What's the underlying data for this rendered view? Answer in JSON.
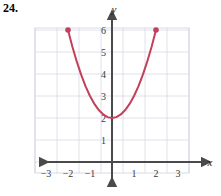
{
  "problem": {
    "number": "24."
  },
  "colors": {
    "curve": "#C2405C",
    "point": "#C2405C",
    "axis": "#4a4a4a",
    "grid": "#d8d8e4",
    "grid_border": "#cfcfdd",
    "text": "#3a3a3a",
    "background": "#ffffff"
  },
  "chart_data": {
    "type": "line",
    "title": "",
    "xlabel": "x",
    "ylabel": "y",
    "function": "y = x^2 + 2",
    "grid": true,
    "legend": "none",
    "xlim": [
      -3.5,
      3.5
    ],
    "ylim": [
      -1.0,
      6.5
    ],
    "xticks": [
      -3,
      -2,
      -1,
      1,
      2,
      3
    ],
    "yticks": [
      1,
      2,
      3,
      4,
      5,
      6
    ],
    "xtick_labels": [
      "−3",
      "−2",
      "−1",
      "1",
      "2",
      "3"
    ],
    "ytick_labels": [
      "1",
      "2",
      "3",
      "4",
      "5",
      "6"
    ],
    "domain": [
      -2,
      2
    ],
    "vertex": [
      0,
      2
    ],
    "endpoints": [
      {
        "x": -2,
        "y": 6,
        "marker": "filled-circle"
      },
      {
        "x": 2,
        "y": 6,
        "marker": "filled-circle"
      }
    ],
    "x": [
      -2.0,
      -1.8,
      -1.6,
      -1.4,
      -1.2,
      -1.0,
      -0.8,
      -0.6,
      -0.4,
      -0.2,
      0.0,
      0.2,
      0.4,
      0.6,
      0.8,
      1.0,
      1.2,
      1.4,
      1.6,
      1.8,
      2.0
    ],
    "values": [
      6.0,
      5.24,
      4.56,
      3.96,
      3.44,
      3.0,
      2.64,
      2.36,
      2.16,
      2.04,
      2.0,
      2.04,
      2.16,
      2.36,
      2.64,
      3.0,
      3.44,
      3.96,
      4.56,
      5.24,
      6.0
    ]
  },
  "axes": {
    "x_axis_label": "x",
    "y_axis_label": "y",
    "x_arrow_left": true,
    "x_arrow_right": true,
    "y_arrow_up": true,
    "y_arrow_down": true
  }
}
